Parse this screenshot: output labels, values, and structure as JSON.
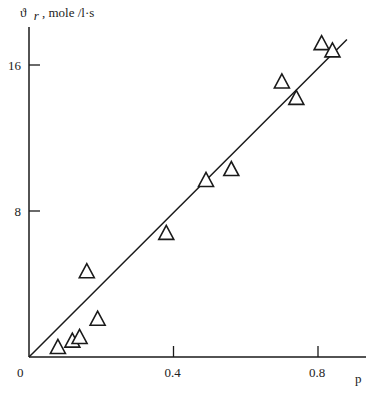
{
  "chart_data": {
    "type": "scatter",
    "title": "",
    "ylabel": "ϑ r, mole /l·s",
    "ylabel_parts": {
      "symbol": "ϑ",
      "subscript": "r",
      "units": ", mole /l·s"
    },
    "xlabel": "p",
    "origin_label": "0",
    "xlim": [
      0,
      0.9
    ],
    "ylim": [
      0,
      18
    ],
    "x_ticks": [
      0.4,
      0.8
    ],
    "x_tick_labels": [
      "0.4",
      "0.8"
    ],
    "y_ticks": [
      8,
      16
    ],
    "y_tick_labels": [
      "8",
      "16"
    ],
    "grid": false,
    "marker": "open-triangle",
    "series": [
      {
        "name": "experimental",
        "points": [
          {
            "x": 0.08,
            "y": 0.55
          },
          {
            "x": 0.12,
            "y": 0.9
          },
          {
            "x": 0.14,
            "y": 1.1
          },
          {
            "x": 0.19,
            "y": 2.1
          },
          {
            "x": 0.16,
            "y": 4.7
          },
          {
            "x": 0.38,
            "y": 6.8
          },
          {
            "x": 0.49,
            "y": 9.7
          },
          {
            "x": 0.56,
            "y": 10.3
          },
          {
            "x": 0.7,
            "y": 15.1
          },
          {
            "x": 0.74,
            "y": 14.2
          },
          {
            "x": 0.81,
            "y": 17.2
          },
          {
            "x": 0.84,
            "y": 16.8
          }
        ]
      }
    ],
    "fit_line": {
      "x": [
        0,
        0.88
      ],
      "y": [
        0,
        17.4
      ]
    }
  }
}
